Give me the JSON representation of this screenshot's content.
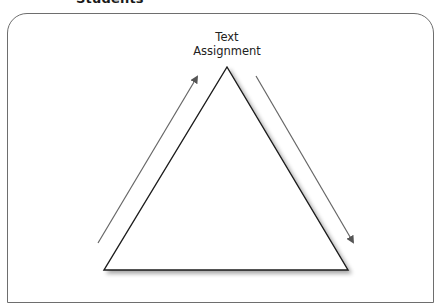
{
  "diagram": {
    "header_label": "Students",
    "apex_label_line1": "Text",
    "apex_label_line2": "Assignment",
    "shape": "triangle",
    "arrows": [
      {
        "name": "left-side-arrow",
        "direction": "up-right"
      },
      {
        "name": "right-side-arrow",
        "direction": "down-right"
      }
    ],
    "colors": {
      "frame": "#6e6e6e",
      "triangle": "#1a1a1a",
      "arrows": "#666666",
      "text": "#222222"
    }
  }
}
